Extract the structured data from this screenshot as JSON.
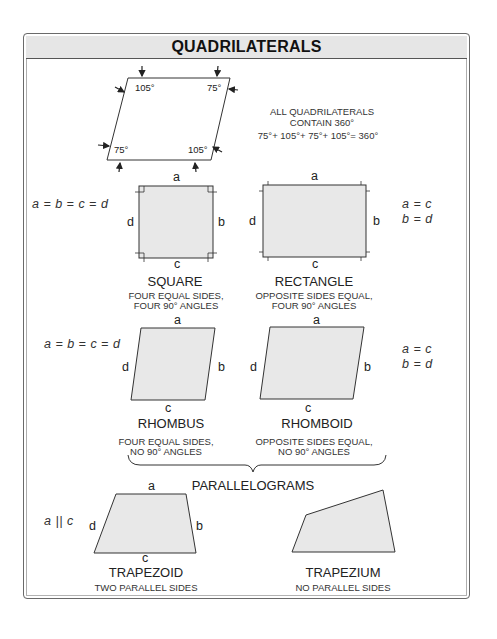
{
  "title": "QUADRILATERALS",
  "intro": {
    "angles": {
      "top_left": "105°",
      "top_right": "75°",
      "bottom_left": "75°",
      "bottom_right": "105°"
    },
    "note_line1": "ALL QUADRILATERALS",
    "note_line2": "CONTAIN 360°",
    "note_equation": "75°+ 105°+ 75°+ 105°= 360°"
  },
  "sides": {
    "a": "a",
    "b": "b",
    "c": "c",
    "d": "d"
  },
  "row1": {
    "left_equation": "a = b = c = d",
    "right_equation_1": "a = c",
    "right_equation_2": "b = d",
    "shapes": [
      {
        "name": "SQUARE",
        "desc1": "FOUR EQUAL SIDES,",
        "desc2": "FOUR 90° ANGLES"
      },
      {
        "name": "RECTANGLE",
        "desc1": "OPPOSITE SIDES EQUAL,",
        "desc2": "FOUR 90° ANGLES"
      }
    ]
  },
  "row2": {
    "left_equation": "a = b = c = d",
    "right_equation_1": "a = c",
    "right_equation_2": "b = d",
    "shapes": [
      {
        "name": "RHOMBUS",
        "desc1": "FOUR EQUAL SIDES,",
        "desc2": "NO 90° ANGLES"
      },
      {
        "name": "RHOMBOID",
        "desc1": "OPPOSITE SIDES EQUAL,",
        "desc2": "NO 90° ANGLES"
      }
    ],
    "group_label": "PARALLELOGRAMS"
  },
  "row3": {
    "left_equation": "a || c",
    "shapes": [
      {
        "name": "TRAPEZOID",
        "desc1": "TWO PARALLEL SIDES"
      },
      {
        "name": "TRAPEZIUM",
        "desc1": "NO PARALLEL SIDES"
      }
    ]
  },
  "colors": {
    "fill": "#e8e8e8",
    "stroke": "#333333",
    "header_bg": "#e6e6e6"
  }
}
